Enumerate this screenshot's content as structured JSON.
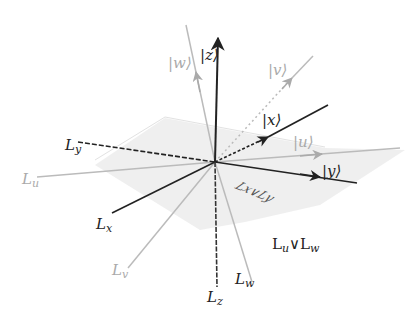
{
  "diagram": {
    "type": "3d-subspace-lattice",
    "origin": [
      215,
      162
    ],
    "colors": {
      "primary": "#222222",
      "secondary": "#aaaaaa",
      "plane": "#e9e9e9"
    },
    "vectors": [
      {
        "id": "z",
        "label": "|z⟩",
        "style": "solid-dark"
      },
      {
        "id": "w",
        "label": "|w⟩",
        "style": "solid-gray"
      },
      {
        "id": "v",
        "label": "|v⟩",
        "style": "dotted-gray"
      },
      {
        "id": "x",
        "label": "|x⟩",
        "style": "dashed-dark"
      },
      {
        "id": "u",
        "label": "|u⟩",
        "style": "solid-gray"
      },
      {
        "id": "y",
        "label": "|y⟩",
        "style": "solid-dark"
      }
    ],
    "lines": [
      {
        "id": "Ly",
        "base": "L",
        "sub": "y"
      },
      {
        "id": "Lu",
        "base": "L",
        "sub": "u"
      },
      {
        "id": "Lx",
        "base": "L",
        "sub": "x"
      },
      {
        "id": "Lv",
        "base": "L",
        "sub": "v"
      },
      {
        "id": "Lz",
        "base": "L",
        "sub": "z"
      },
      {
        "id": "Lw",
        "base": "L",
        "sub": "w"
      }
    ],
    "planes": [
      {
        "id": "LxLy",
        "label": "Lx∨Ly"
      },
      {
        "id": "LuLw",
        "label_base1": "L",
        "label_sub1": "u",
        "label_op": "∨",
        "label_base2": "L",
        "label_sub2": "w"
      }
    ]
  }
}
